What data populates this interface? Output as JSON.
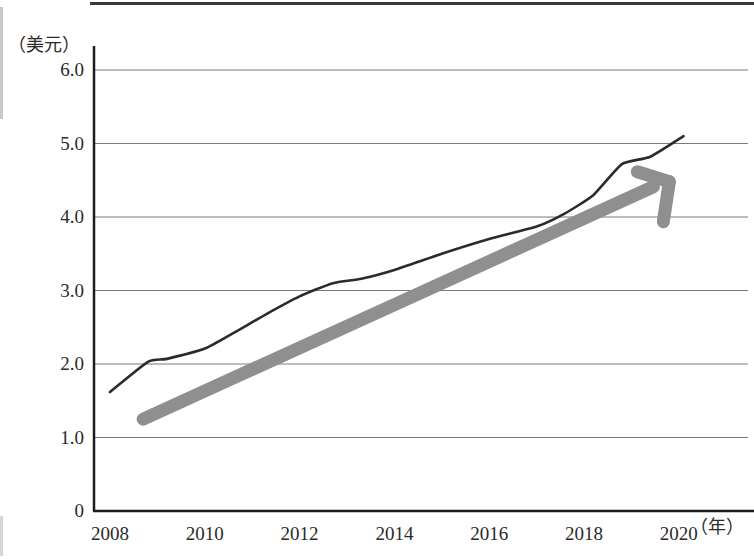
{
  "chart_data": {
    "type": "line",
    "title": "",
    "subtitle": "",
    "xlabel": "（年）",
    "ylabel": "（美元）",
    "xlim": [
      2008,
      2020.5
    ],
    "ylim": [
      0,
      6.0
    ],
    "grid": true,
    "legend": null,
    "y_ticks": [
      "6.0",
      "5.0",
      "4.0",
      "3.0",
      "2.0",
      "1.0",
      "0"
    ],
    "y_tick_values": [
      6.0,
      5.0,
      4.0,
      3.0,
      2.0,
      1.0,
      0
    ],
    "x_ticks": [
      "2008",
      "2010",
      "2012",
      "2014",
      "2016",
      "2018",
      "2020"
    ],
    "x_tick_values": [
      2008,
      2010,
      2012,
      2014,
      2016,
      2018,
      2020
    ],
    "series": [
      {
        "name": "data-line",
        "style": "solid",
        "color": "#2b2b2b",
        "x": [
          2008.0,
          2008.8,
          2009.2,
          2010.0,
          2010.6,
          2011.3,
          2012.0,
          2012.7,
          2013.3,
          2014.0,
          2015.0,
          2016.0,
          2017.0,
          2017.6,
          2018.2,
          2018.8,
          2019.4,
          2020.1
        ],
        "values": [
          1.62,
          2.03,
          2.07,
          2.21,
          2.42,
          2.68,
          2.92,
          3.1,
          3.16,
          3.28,
          3.5,
          3.7,
          3.87,
          4.05,
          4.3,
          4.72,
          4.82,
          5.1
        ]
      },
      {
        "name": "trend-arrow",
        "style": "arrow",
        "color": "#8f8f8f",
        "x": [
          2008.7,
          2019.8
        ],
        "values": [
          1.25,
          4.48
        ]
      }
    ],
    "annotations": [
      {
        "name": "trend-arrow-head",
        "x": 2019.8,
        "y": 4.48,
        "direction": "up-right"
      }
    ]
  },
  "axes": {
    "y_title": "（美元）",
    "x_title": "（年）"
  }
}
